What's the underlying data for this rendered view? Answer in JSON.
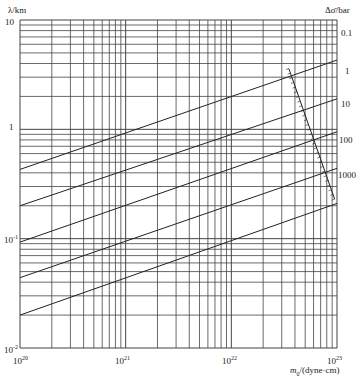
{
  "chart_data": {
    "type": "line",
    "title": "",
    "xlabel": "m0/(dyne·cm)",
    "ylabel": "λ/km",
    "right_label": "Δσ̄/bar",
    "xscale": "log",
    "yscale": "log",
    "xlim": [
      1e+20,
      1e+23
    ],
    "ylim": [
      0.01,
      10
    ],
    "x_tick_labels": [
      "10^20",
      "10^21",
      "10^22",
      "10^23"
    ],
    "y_tick_labels": [
      "10",
      "1",
      "10^-1",
      "10^-2"
    ],
    "grid": true,
    "series": [
      {
        "name": "0.1",
        "x": [
          1e+20,
          1e+23
        ],
        "y": [
          0.43,
          4.3
        ]
      },
      {
        "name": "1",
        "x": [
          1e+20,
          1e+23
        ],
        "y": [
          0.2,
          1.9
        ]
      },
      {
        "name": "10",
        "x": [
          1e+20,
          1e+23
        ],
        "y": [
          0.093,
          0.95
        ]
      },
      {
        "name": "100",
        "x": [
          1e+20,
          1e+23
        ],
        "y": [
          0.044,
          0.44
        ]
      },
      {
        "name": "1000",
        "x": [
          1e+20,
          1e+23
        ],
        "y": [
          0.02,
          0.21
        ]
      }
    ],
    "annotation_line": {
      "name": "hatched boundary",
      "x": [
        3.5e+22,
        9.5e+22
      ],
      "y": [
        3.6,
        0.23
      ]
    }
  },
  "labels": {
    "ylabel": "λ/km",
    "right_label": "Δσ̄/bar",
    "xlabel_m": "m",
    "xlabel_sub": "0",
    "xlabel_rest": "/(dyne·cm)",
    "y_ticks": [
      {
        "base": "10",
        "exp": ""
      },
      {
        "base": "1",
        "exp": ""
      },
      {
        "base": "10",
        "exp": "-1"
      },
      {
        "base": "10",
        "exp": "-2"
      }
    ],
    "x_ticks": [
      {
        "base": "10",
        "exp": "20"
      },
      {
        "base": "10",
        "exp": "21"
      },
      {
        "base": "10",
        "exp": "22"
      },
      {
        "base": "10",
        "exp": "23"
      }
    ],
    "series_labels": [
      "0.1",
      "1",
      "10",
      "100",
      "1000"
    ]
  }
}
